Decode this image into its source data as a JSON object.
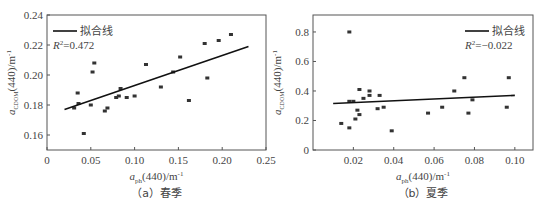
{
  "chart_data": [
    {
      "type": "scatter",
      "caption": "（a）春季",
      "xlabel": "a_ph(440)/m^-1",
      "ylabel": "a_CDOM(440)/m^-1",
      "xlim": [
        0,
        0.25
      ],
      "ylim": [
        0.15,
        0.24
      ],
      "xticks": [
        "0",
        "0.05",
        "0.10",
        "0.15",
        "0.20",
        "0.25"
      ],
      "yticks": [
        "0.16",
        "0.18",
        "0.20",
        "0.22",
        "0.24"
      ],
      "legend": {
        "label": "拟合线",
        "r2": "R²=0.472",
        "position": "upper-left"
      },
      "fit_line": {
        "x": [
          0.02,
          0.23
        ],
        "y": [
          0.177,
          0.219
        ]
      },
      "points": [
        [
          0.035,
          0.188
        ],
        [
          0.036,
          0.181
        ],
        [
          0.031,
          0.178
        ],
        [
          0.05,
          0.18
        ],
        [
          0.042,
          0.161
        ],
        [
          0.052,
          0.202
        ],
        [
          0.054,
          0.208
        ],
        [
          0.066,
          0.176
        ],
        [
          0.069,
          0.178
        ],
        [
          0.079,
          0.185
        ],
        [
          0.082,
          0.186
        ],
        [
          0.084,
          0.191
        ],
        [
          0.091,
          0.185
        ],
        [
          0.1,
          0.186
        ],
        [
          0.113,
          0.207
        ],
        [
          0.13,
          0.192
        ],
        [
          0.144,
          0.202
        ],
        [
          0.152,
          0.212
        ],
        [
          0.162,
          0.183
        ],
        [
          0.18,
          0.221
        ],
        [
          0.183,
          0.198
        ],
        [
          0.196,
          0.223
        ],
        [
          0.21,
          0.227
        ]
      ]
    },
    {
      "type": "scatter",
      "caption": "（b）夏季",
      "xlabel": "a_ph(440)/m^-1",
      "ylabel": "a_CDOM(440)/m^-1",
      "xlim": [
        0,
        0.109
      ],
      "ylim": [
        0,
        0.915
      ],
      "xticks": [
        "0.02",
        "0.04",
        "0.06",
        "0.08",
        "0.10"
      ],
      "yticks": [
        "0",
        "0.2",
        "0.4",
        "0.6",
        "0.8"
      ],
      "legend": {
        "label": "拟合线",
        "r2": "R²=−0.022",
        "position": "upper-right"
      },
      "fit_line": {
        "x": [
          0.01,
          0.1
        ],
        "y": [
          0.315,
          0.37
        ]
      },
      "points": [
        [
          0.018,
          0.8
        ],
        [
          0.014,
          0.18
        ],
        [
          0.018,
          0.15
        ],
        [
          0.018,
          0.33
        ],
        [
          0.02,
          0.33
        ],
        [
          0.023,
          0.41
        ],
        [
          0.021,
          0.21
        ],
        [
          0.022,
          0.27
        ],
        [
          0.023,
          0.24
        ],
        [
          0.025,
          0.35
        ],
        [
          0.028,
          0.4
        ],
        [
          0.028,
          0.37
        ],
        [
          0.032,
          0.28
        ],
        [
          0.033,
          0.37
        ],
        [
          0.035,
          0.29
        ],
        [
          0.039,
          0.13
        ],
        [
          0.057,
          0.25
        ],
        [
          0.064,
          0.29
        ],
        [
          0.07,
          0.4
        ],
        [
          0.075,
          0.49
        ],
        [
          0.077,
          0.25
        ],
        [
          0.079,
          0.34
        ],
        [
          0.096,
          0.29
        ],
        [
          0.097,
          0.49
        ]
      ]
    }
  ],
  "panels": {
    "a": {
      "caption": "（a）春季",
      "legend_label": "拟合线",
      "r2": "=0.472",
      "xlabel_main": "a",
      "xlabel_sub": "ph",
      "xlabel_rest": "(440)/m",
      "ylabel_main": "a",
      "ylabel_sub": "CDOM",
      "ylabel_rest": "(440)/m",
      "unit_exp": "-1"
    },
    "b": {
      "caption": "（b）夏季",
      "legend_label": "拟合线",
      "r2": "=−0.022",
      "xlabel_main": "a",
      "xlabel_sub": "ph",
      "xlabel_rest": "(440)/m",
      "ylabel_main": "a",
      "ylabel_sub": "CDOM",
      "ylabel_rest": "(440)/m",
      "unit_exp": "-1"
    }
  }
}
